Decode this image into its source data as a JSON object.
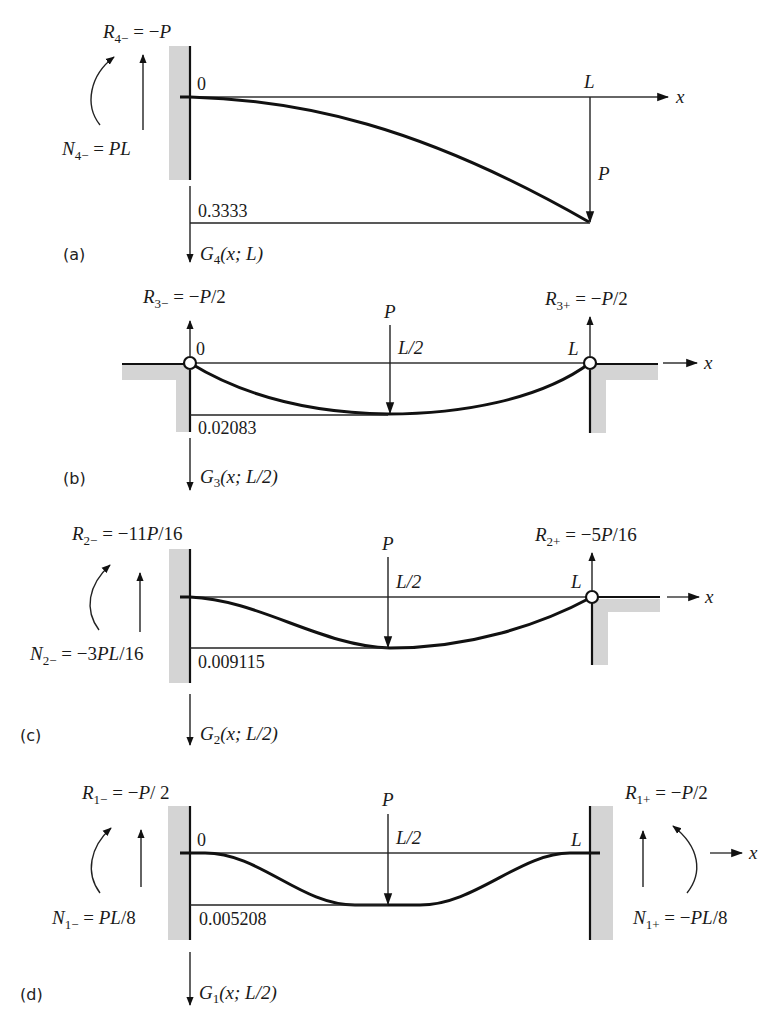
{
  "figure": {
    "panels": [
      {
        "id": "a",
        "label": "(a)",
        "support_left": "clamped",
        "support_right": "free",
        "origin_label": "0",
        "end_label": "L",
        "axis_label": "x",
        "load_label": "P",
        "load_position": "L",
        "max_deflection": "0.3333",
        "function_label": "G₄(x; L)",
        "reaction_left": {
          "name": "R",
          "sub": "4−",
          "value": "= −P"
        },
        "moment_left": {
          "name": "N",
          "sub": "4−",
          "value": "= PL"
        }
      },
      {
        "id": "b",
        "label": "(b)",
        "support_left": "pinned",
        "support_right": "pinned",
        "origin_label": "0",
        "end_label": "L",
        "axis_label": "x",
        "load_label": "P",
        "load_position": "L/2",
        "max_deflection": "0.02083",
        "function_label": "G₃(x; L/2)",
        "reaction_left": {
          "name": "R",
          "sub": "3−",
          "value": "= −P/2"
        },
        "reaction_right": {
          "name": "R",
          "sub": "3+",
          "value": "= −P/2"
        }
      },
      {
        "id": "c",
        "label": "(c)",
        "support_left": "clamped",
        "support_right": "pinned",
        "end_label": "L",
        "axis_label": "x",
        "load_label": "P",
        "load_position": "L/2",
        "max_deflection": "0.009115",
        "function_label": "G₂(x; L/2)",
        "reaction_left": {
          "name": "R",
          "sub": "2−",
          "value": "= −11P/16"
        },
        "moment_left": {
          "name": "N",
          "sub": "2−",
          "value": "= −3PL/16"
        },
        "reaction_right": {
          "name": "R",
          "sub": "2+",
          "value": "= −5P/16"
        }
      },
      {
        "id": "d",
        "label": "(d)",
        "support_left": "clamped",
        "support_right": "clamped",
        "origin_label": "0",
        "end_label": "L",
        "axis_label": "x",
        "load_label": "P",
        "load_position": "L/2",
        "max_deflection": "0.005208",
        "function_label": "G₁(x; L/2)",
        "reaction_left": {
          "name": "R",
          "sub": "1−",
          "value": "= −P/2"
        },
        "moment_left": {
          "name": "N",
          "sub": "1−",
          "value": "= PL/8"
        },
        "reaction_right": {
          "name": "R",
          "sub": "1+",
          "value": "= −P/2"
        },
        "moment_right": {
          "name": "N",
          "sub": "1+",
          "value": "= −PL/8"
        }
      }
    ]
  }
}
